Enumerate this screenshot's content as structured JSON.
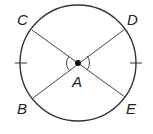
{
  "diagram": {
    "type": "circle-geometry",
    "center": {
      "label": "A",
      "x": 78,
      "y": 63
    },
    "radius": 58,
    "points": [
      {
        "label": "C",
        "x": 32,
        "y": 30,
        "lx": 17,
        "ly": 25
      },
      {
        "label": "D",
        "x": 125,
        "y": 29,
        "lx": 127,
        "ly": 25
      },
      {
        "label": "B",
        "x": 33,
        "y": 98,
        "lx": 17,
        "ly": 114
      },
      {
        "label": "E",
        "x": 125,
        "y": 97,
        "lx": 126,
        "ly": 114
      }
    ],
    "segments": [
      "CE",
      "DB"
    ],
    "congruent_arc_ticks": "left and right arcs marked",
    "angle_marks": "vertical angles CAB and DAE marked congruent",
    "stroke_color": "#333333"
  }
}
